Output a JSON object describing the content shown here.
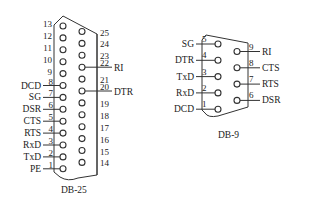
{
  "db25": {
    "title": "DB-25",
    "top_row": [
      {
        "pin": "13",
        "signal": ""
      },
      {
        "pin": "12",
        "signal": ""
      },
      {
        "pin": "11",
        "signal": ""
      },
      {
        "pin": "10",
        "signal": ""
      },
      {
        "pin": "9",
        "signal": ""
      },
      {
        "pin": "8",
        "signal": "DCD"
      },
      {
        "pin": "7",
        "signal": "SG"
      },
      {
        "pin": "6",
        "signal": "DSR"
      },
      {
        "pin": "5",
        "signal": "CTS"
      },
      {
        "pin": "4",
        "signal": "RTS"
      },
      {
        "pin": "3",
        "signal": "RxD"
      },
      {
        "pin": "2",
        "signal": "TxD"
      },
      {
        "pin": "1",
        "signal": "PE"
      }
    ],
    "bottom_row": [
      {
        "pin": "25",
        "signal": ""
      },
      {
        "pin": "24",
        "signal": ""
      },
      {
        "pin": "23",
        "signal": ""
      },
      {
        "pin": "22",
        "signal": "RI"
      },
      {
        "pin": "21",
        "signal": ""
      },
      {
        "pin": "20",
        "signal": "DTR"
      },
      {
        "pin": "19",
        "signal": ""
      },
      {
        "pin": "18",
        "signal": ""
      },
      {
        "pin": "17",
        "signal": ""
      },
      {
        "pin": "16",
        "signal": ""
      },
      {
        "pin": "15",
        "signal": ""
      },
      {
        "pin": "14",
        "signal": ""
      }
    ]
  },
  "db9": {
    "title": "DB-9",
    "top_row": [
      {
        "pin": "5",
        "signal": "SG"
      },
      {
        "pin": "4",
        "signal": "DTR"
      },
      {
        "pin": "3",
        "signal": "TxD"
      },
      {
        "pin": "2",
        "signal": "RxD"
      },
      {
        "pin": "1",
        "signal": "DCD"
      }
    ],
    "bottom_row": [
      {
        "pin": "9",
        "signal": "RI"
      },
      {
        "pin": "8",
        "signal": "CTS"
      },
      {
        "pin": "7",
        "signal": "RTS"
      },
      {
        "pin": "6",
        "signal": "DSR"
      }
    ]
  }
}
